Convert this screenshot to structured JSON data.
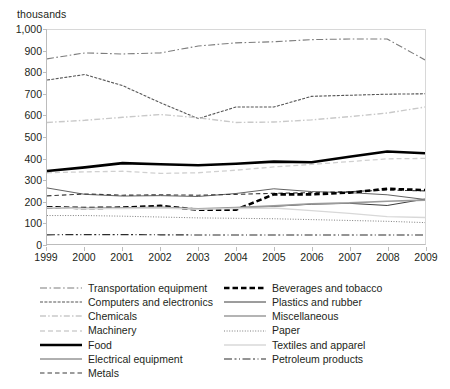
{
  "axis_unit_label": "thousands",
  "chart_data": {
    "type": "line",
    "title": "",
    "subtitle": "",
    "xlabel": "",
    "ylabel": "thousands",
    "ylim": [
      0,
      1000
    ],
    "ytick_step": 100,
    "grid": false,
    "legend_position": "bottom",
    "categories": [
      "1999",
      "2000",
      "2001",
      "2002",
      "2003",
      "2004",
      "2005",
      "2006",
      "2007",
      "2008",
      "2009"
    ],
    "ytick_labels": [
      "0",
      "100",
      "200",
      "300",
      "400",
      "500",
      "600",
      "700",
      "800",
      "900",
      "1,000"
    ],
    "series": [
      {
        "name": "Transportation equipment",
        "style": "dash-dot",
        "color": "#7d7d7d",
        "width": 1.1,
        "values": [
          865,
          893,
          888,
          893,
          925,
          940,
          945,
          955,
          958,
          958,
          860
        ]
      },
      {
        "name": "Computers and electronics",
        "style": "fine-dash",
        "color": "#555555",
        "width": 1.1,
        "values": [
          766,
          792,
          740,
          660,
          586,
          640,
          640,
          690,
          695,
          700,
          702
        ]
      },
      {
        "name": "Chemicals",
        "style": "dash-dot-light",
        "color": "#c9c9c9",
        "width": 1.4,
        "values": [
          568,
          578,
          592,
          605,
          590,
          568,
          570,
          580,
          595,
          612,
          640
        ]
      },
      {
        "name": "Machinery",
        "style": "dash-light",
        "color": "#d0d0d0",
        "width": 1.3,
        "values": [
          333,
          337,
          340,
          330,
          333,
          345,
          360,
          372,
          385,
          398,
          400
        ]
      },
      {
        "name": "Food",
        "style": "solid-heavy",
        "color": "#000000",
        "width": 2.6,
        "values": [
          341,
          358,
          378,
          373,
          368,
          375,
          385,
          382,
          408,
          432,
          424
        ]
      },
      {
        "name": "Electrical equipment",
        "style": "solid-thin",
        "color": "#4f4f4f",
        "width": 0.9,
        "values": [
          262,
          232,
          224,
          226,
          222,
          236,
          258,
          245,
          240,
          230,
          208
        ]
      },
      {
        "name": "Metals",
        "style": "dash",
        "color": "#3a3a3a",
        "width": 1.1,
        "values": [
          225,
          234,
          228,
          230,
          228,
          232,
          237,
          240,
          245,
          252,
          248
        ]
      },
      {
        "name": "Beverages and tobacco",
        "style": "heavy-dash",
        "color": "#000000",
        "width": 2.6,
        "values": [
          172,
          168,
          170,
          178,
          160,
          160,
          232,
          232,
          240,
          258,
          252
        ]
      },
      {
        "name": "Plastics and rubber",
        "style": "solid-thin",
        "color": "#3a3a3a",
        "width": 1.0,
        "values": [
          170,
          167,
          168,
          172,
          163,
          168,
          176,
          186,
          190,
          180,
          210
        ]
      },
      {
        "name": "Miscellaneous",
        "style": "solid-gray",
        "color": "#9b9b9b",
        "width": 1.6,
        "values": [
          170,
          166,
          168,
          172,
          165,
          170,
          178,
          188,
          192,
          200,
          205
        ]
      },
      {
        "name": "Paper",
        "style": "dotted",
        "color": "#6f6f6f",
        "width": 0.9,
        "values": [
          133,
          133,
          130,
          126,
          122,
          120,
          118,
          114,
          110,
          106,
          100
        ]
      },
      {
        "name": "Textiles and apparel",
        "style": "solid-pale",
        "color": "#d8d8d8",
        "width": 1.4,
        "values": [
          170,
          166,
          166,
          168,
          162,
          166,
          168,
          156,
          143,
          128,
          124
        ]
      },
      {
        "name": "Petroleum products",
        "style": "long-dash-dot",
        "color": "#2b2b2b",
        "width": 1.2,
        "values": [
          43,
          44,
          44,
          43,
          42,
          42,
          42,
          42,
          42,
          42,
          42
        ]
      }
    ]
  },
  "legend": {
    "columns": [
      {
        "items": [
          {
            "label": "Transportation equipment",
            "series": 0
          },
          {
            "label": "Computers and electronics",
            "series": 1
          },
          {
            "label": "Chemicals",
            "series": 2
          },
          {
            "label": "Machinery",
            "series": 3
          },
          {
            "label": "Food",
            "series": 4
          },
          {
            "label": "Electrical equipment",
            "series": 5
          },
          {
            "label": "Metals",
            "series": 6
          }
        ]
      },
      {
        "items": [
          {
            "label": "Beverages and tobacco",
            "series": 7
          },
          {
            "label": "Plastics and rubber",
            "series": 8
          },
          {
            "label": "Miscellaneous",
            "series": 9
          },
          {
            "label": "Paper",
            "series": 10
          },
          {
            "label": "Textiles and apparel",
            "series": 11
          },
          {
            "label": "Petroleum products",
            "series": 12
          }
        ]
      }
    ]
  }
}
